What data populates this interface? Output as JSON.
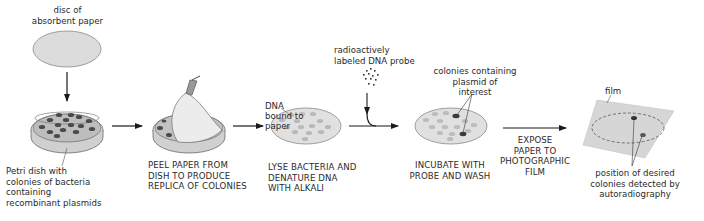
{
  "diagram": {
    "colors": {
      "paper_fill": "#d9d9d9",
      "colony_dark": "#4a4a4a",
      "colony_light": "#b8b8b8",
      "film_fill": "#d4d4d4",
      "line": "#1a1a1a"
    },
    "labels": {
      "disc": "disc of\nabsorbent paper",
      "petri": "Petri dish with\ncolonies of bacteria\ncontaining\nrecombinant plasmids",
      "dna_bound": "DNA\nbound to\npaper",
      "probe": "radioactively\nlabeled DNA probe",
      "colonies_plasmid": "colonies containing\nplasmid of\ninterest",
      "film": "film",
      "position": "position of desired\ncolonies detected by\nautoradiography"
    },
    "steps": [
      {
        "id": "peel",
        "caption": "PEEL PAPER FROM\nDISH TO PRODUCE\nREPLICA OF COLONIES"
      },
      {
        "id": "lyse",
        "caption": "LYSE BACTERIA AND\nDENATURE DNA\nWITH ALKALI"
      },
      {
        "id": "incubate",
        "caption": "INCUBATE WITH\nPROBE AND WASH"
      },
      {
        "id": "expose",
        "caption": "EXPOSE\nPAPER TO\nPHOTOGRAPHIC\nFILM"
      }
    ]
  }
}
